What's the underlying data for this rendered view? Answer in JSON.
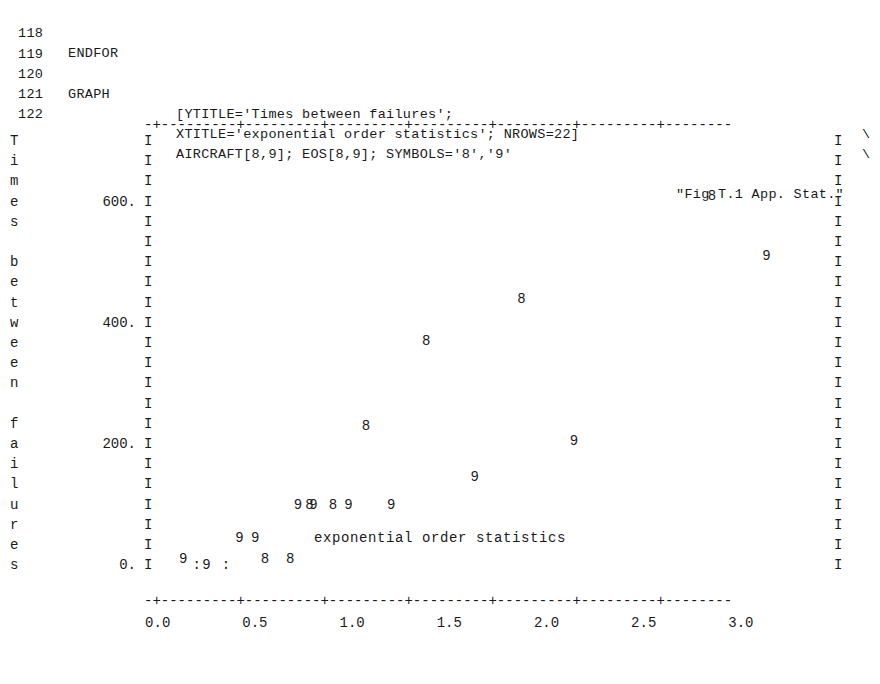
{
  "listing": {
    "lines": [
      {
        "no": "118",
        "kw": "ENDFOR",
        "body": "",
        "cont": "",
        "comment": ""
      },
      {
        "no": "119",
        "kw": "",
        "body": "",
        "cont": "",
        "comment": ""
      },
      {
        "no": "120",
        "kw": "GRAPH",
        "body": "[YTITLE='Times between failures';",
        "cont": "\\",
        "comment": ""
      },
      {
        "no": "121",
        "kw": "",
        "body": "XTITLE='exponential order statistics'; NROWS=22]",
        "cont": "\\",
        "comment": ""
      },
      {
        "no": "122",
        "kw": "",
        "body": "AIRCRAFT[8,9]; EOS[8,9]; SYMBOLS='8','9'",
        "cont": "",
        "comment": "\"Fig T.1 App. Stat.\""
      }
    ]
  },
  "plot": {
    "ytitle": "Times between failures",
    "ytitle_chars": [
      "T",
      "i",
      "m",
      "e",
      "s",
      "",
      "b",
      "e",
      "t",
      "w",
      "e",
      "e",
      "n",
      "",
      "f",
      "a",
      "i",
      "l",
      "u",
      "r",
      "e",
      "s"
    ],
    "xtitle": "exponential order statistics",
    "frame_top": "-+---------+---------+---------+---------+---------+---------+--------",
    "frame_bottom": "-+---------+---------+---------+---------+---------+---------+--------",
    "border_char": "I",
    "nrows": 22,
    "ylabels": [
      {
        "text": "600.",
        "row": 3
      },
      {
        "text": "400.",
        "row": 9
      },
      {
        "text": "200.",
        "row": 15
      },
      {
        "text": "0.",
        "row": 21
      }
    ],
    "xlabels": [
      "0.0",
      "0.5",
      "1.0",
      "1.5",
      "2.0",
      "2.5",
      "3.0"
    ],
    "baseline_markers": [
      {
        "text": ":",
        "col": 5,
        "row": 21
      },
      {
        "text": "9",
        "col": 6,
        "row": 21
      },
      {
        "text": ":",
        "col": 8,
        "row": 21
      }
    ]
  },
  "chart_data": {
    "type": "scatter",
    "title": "Fig T.1 App. Stat.",
    "xlabel": "exponential order statistics",
    "ylabel": "Times between failures",
    "xlim": [
      0.0,
      3.4
    ],
    "ylim": [
      0,
      700
    ],
    "xticks": [
      0.0,
      0.5,
      1.0,
      1.5,
      2.0,
      2.5,
      3.0
    ],
    "yticks": [
      0,
      200,
      400,
      600
    ],
    "grid": false,
    "legend": "none",
    "symbols": {
      "aircraft8": "8",
      "aircraft9": "9"
    },
    "series": [
      {
        "name": "AIRCRAFT 8",
        "symbol": "8",
        "points": [
          {
            "x": 0.55,
            "y": 10
          },
          {
            "x": 0.68,
            "y": 10
          },
          {
            "x": 0.78,
            "y": 100
          },
          {
            "x": 0.9,
            "y": 100
          },
          {
            "x": 1.07,
            "y": 230
          },
          {
            "x": 1.38,
            "y": 370
          },
          {
            "x": 1.87,
            "y": 440
          },
          {
            "x": 2.85,
            "y": 610
          }
        ]
      },
      {
        "name": "AIRCRAFT 9",
        "symbol": "9",
        "points": [
          {
            "x": 0.13,
            "y": 10
          },
          {
            "x": 0.42,
            "y": 45
          },
          {
            "x": 0.5,
            "y": 45
          },
          {
            "x": 0.72,
            "y": 100
          },
          {
            "x": 0.8,
            "y": 100
          },
          {
            "x": 0.98,
            "y": 100
          },
          {
            "x": 1.2,
            "y": 100
          },
          {
            "x": 1.63,
            "y": 145
          },
          {
            "x": 2.14,
            "y": 205
          },
          {
            "x": 3.13,
            "y": 510
          }
        ]
      }
    ]
  }
}
